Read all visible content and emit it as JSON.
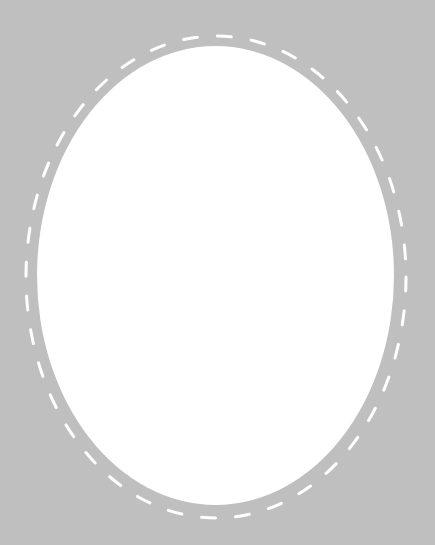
{
  "canvas": {
    "width": 435,
    "height": 545,
    "background_color": "#bfbfbf"
  },
  "oval_frame": {
    "fill_color": "#ffffff",
    "cx": 215.5,
    "cy": 275.5,
    "rx": 178.5,
    "ry": 229.5
  },
  "stitch_border": {
    "stroke_color": "#ffffff",
    "cx": 216,
    "cy": 277,
    "rx": 190,
    "ry": 241,
    "dash_length": 14,
    "gap_length": 20,
    "stroke_width": 3
  }
}
